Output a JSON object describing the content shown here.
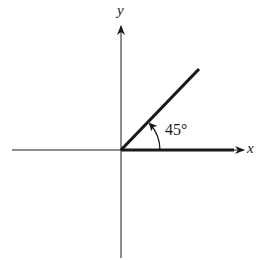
{
  "diagram": {
    "title": "",
    "axes": {
      "x_label": "x",
      "y_label": "y"
    },
    "angle": {
      "label": "45°",
      "degrees": 45,
      "initial_side": "positive x-axis",
      "terminal_side": "ray in first quadrant",
      "direction": "counterclockwise"
    },
    "colors": {
      "ink": "#1a1a1a",
      "background": "#ffffff"
    }
  }
}
